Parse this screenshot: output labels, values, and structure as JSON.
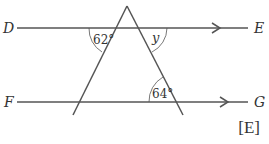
{
  "diagram": {
    "points": {
      "D": "D",
      "E": "E",
      "F": "F",
      "G": "G"
    },
    "angles": {
      "top_left": "62°",
      "top_right": "y",
      "bottom_right": "64°"
    },
    "mark": "[E]",
    "colors": {
      "line": "#555555",
      "text": "#333333"
    }
  }
}
